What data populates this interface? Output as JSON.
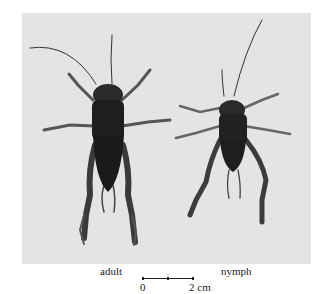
{
  "figure": {
    "photo_background": "#e4e4e2",
    "specimens": [
      {
        "label": "adult",
        "description": "adult cricket, dorsal view"
      },
      {
        "label": "nymph",
        "description": "nymph cricket, dorsal view"
      }
    ],
    "scale_bar": {
      "start_label": "0",
      "end_label": "2 cm"
    }
  }
}
